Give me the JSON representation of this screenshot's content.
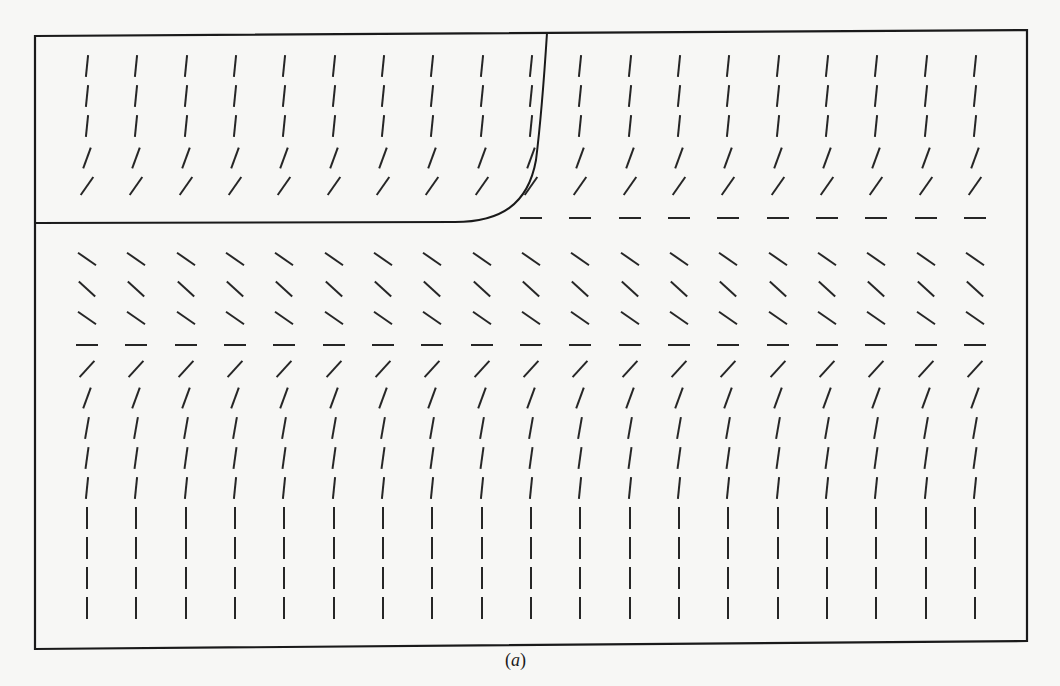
{
  "figure": {
    "caption_open": "(",
    "caption_label": "a",
    "caption_close": ")",
    "frame": {
      "left": 35,
      "top": 33,
      "right": 1027,
      "bottom": 648
    },
    "colors": {
      "ink": "#1a1a1a",
      "paper": "#f7f7f5"
    }
  },
  "chart_data": {
    "type": "slope_field",
    "title": "",
    "caption": "(a)",
    "xlabel": "",
    "ylabel": "",
    "grid": false,
    "columns_x_px": [
      87,
      136,
      186,
      235,
      284,
      334,
      383,
      432,
      482,
      531,
      580,
      630,
      679,
      728,
      778,
      827,
      876,
      926,
      975
    ],
    "segment_length_px": 22,
    "rows": [
      {
        "y_px": 66,
        "angle_deg": 84,
        "from_col": 0
      },
      {
        "y_px": 96,
        "angle_deg": 84,
        "from_col": 0
      },
      {
        "y_px": 126,
        "angle_deg": 84,
        "from_col": 0
      },
      {
        "y_px": 158,
        "angle_deg": 70,
        "from_col": 0
      },
      {
        "y_px": 186,
        "angle_deg": 55,
        "from_col": 0
      },
      {
        "y_px": 218,
        "angle_deg": 0,
        "from_col": 9
      },
      {
        "y_px": 259,
        "angle_deg": -35,
        "from_col": 0
      },
      {
        "y_px": 289,
        "angle_deg": -42,
        "from_col": 0
      },
      {
        "y_px": 318,
        "angle_deg": -35,
        "from_col": 0
      },
      {
        "y_px": 345,
        "angle_deg": 0,
        "from_col": 0
      },
      {
        "y_px": 369,
        "angle_deg": 48,
        "from_col": 0
      },
      {
        "y_px": 398,
        "angle_deg": 70,
        "from_col": 0
      },
      {
        "y_px": 428,
        "angle_deg": 80,
        "from_col": 0
      },
      {
        "y_px": 458,
        "angle_deg": 82,
        "from_col": 0
      },
      {
        "y_px": 488,
        "angle_deg": 84,
        "from_col": 0
      },
      {
        "y_px": 518,
        "angle_deg": 90,
        "from_col": 0
      },
      {
        "y_px": 548,
        "angle_deg": 90,
        "from_col": 0
      },
      {
        "y_px": 578,
        "angle_deg": 90,
        "from_col": 0
      },
      {
        "y_px": 608,
        "angle_deg": 90,
        "from_col": 0
      }
    ],
    "equilibria_rows_y_px": [
      218,
      345
    ],
    "solution_curve": {
      "description": "Solution curve lying along the upper equilibrium from the left edge, then turning upward and leaving through the top edge",
      "path": "M 35 223 L 455 222 C 500 222, 528 205, 536 160 C 541 120, 544 80, 547 33"
    }
  }
}
